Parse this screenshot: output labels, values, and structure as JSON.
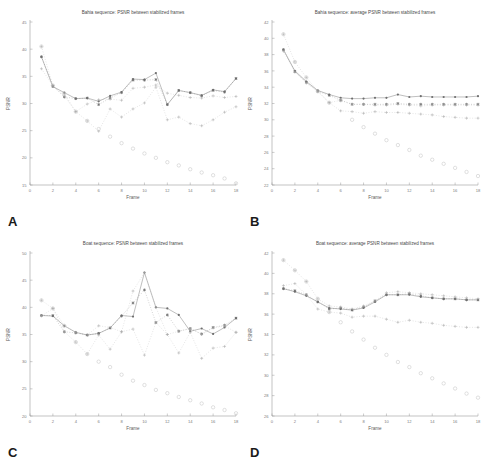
{
  "figure": {
    "panel_labels": [
      "A",
      "B",
      "C",
      "D"
    ],
    "xlabel": "Frame",
    "ylabel": "PSNR",
    "colors": {
      "series_solid": "#8a8a8a",
      "series_star": "#6e6e6e",
      "series_plus": "#a8a8a8",
      "series_circle": "#c0c0c0",
      "axis": "#9a9a9a",
      "text": "#7c7c7c"
    }
  },
  "chart_data": [
    {
      "panel": "A",
      "type": "line",
      "title": "Bahia sequence: PSNR between stabilized frames",
      "xlabel": "Frame",
      "ylabel": "PSNR",
      "xlim": [
        0,
        18
      ],
      "ylim": [
        15,
        45
      ],
      "xticks": [
        0,
        2,
        4,
        6,
        8,
        10,
        12,
        14,
        16,
        18
      ],
      "yticks": [
        15,
        20,
        25,
        30,
        35,
        40,
        45
      ],
      "grid": false,
      "legend": "none",
      "x": [
        1,
        2,
        3,
        4,
        5,
        6,
        7,
        8,
        9,
        10,
        11,
        12,
        13,
        14,
        15,
        16,
        17,
        18
      ],
      "series": [
        {
          "name": "solid-line",
          "marker": "line",
          "values": [
            38.6,
            33.1,
            32.0,
            30.9,
            31.0,
            30.4,
            31.4,
            32.1,
            34.5,
            34.4,
            35.6,
            29.8,
            32.4,
            32.0,
            31.5,
            32.5,
            32.2,
            34.6
          ]
        },
        {
          "name": "star",
          "marker": "star",
          "values": [
            38.6,
            33.2,
            31.2,
            30.9,
            31.0,
            29.8,
            31.0,
            32.0,
            34.3,
            34.3,
            34.4,
            29.8,
            32.4,
            32.0,
            31.4,
            32.4,
            32.1,
            34.6
          ]
        },
        {
          "name": "plus",
          "marker": "plus",
          "values": [
            40.5,
            33.3,
            31.8,
            28.5,
            29.9,
            30.7,
            30.8,
            30.6,
            32.8,
            33.0,
            33.4,
            31.9,
            31.5,
            31.1,
            31.0,
            31.4,
            31.1,
            31.3
          ]
        },
        {
          "name": "plus-low",
          "marker": "plus",
          "values": [
            36.4,
            33.3,
            31.4,
            28.5,
            26.8,
            24.9,
            29.0,
            27.5,
            29.0,
            30.1,
            33.0,
            27.0,
            27.5,
            26.3,
            25.9,
            27.0,
            28.4,
            29.4
          ]
        },
        {
          "name": "circle",
          "marker": "circle",
          "values": [
            40.5,
            33.3,
            31.8,
            28.5,
            26.8,
            25.3,
            23.9,
            22.7,
            21.7,
            20.8,
            20.0,
            19.2,
            18.6,
            17.9,
            17.3,
            16.8,
            16.2,
            15.3
          ]
        }
      ]
    },
    {
      "panel": "B",
      "type": "line",
      "title": "Bahia sequence: average PSNR between stabilized frames",
      "xlabel": "Frame",
      "ylabel": "PSNR",
      "xlim": [
        0,
        18
      ],
      "ylim": [
        22,
        42
      ],
      "xticks": [
        0,
        2,
        4,
        6,
        8,
        10,
        12,
        14,
        16,
        18
      ],
      "yticks": [
        22,
        24,
        26,
        28,
        30,
        32,
        34,
        36,
        38,
        40,
        42
      ],
      "grid": false,
      "legend": "none",
      "x": [
        1,
        2,
        3,
        4,
        5,
        6,
        7,
        8,
        9,
        10,
        11,
        12,
        13,
        14,
        15,
        16,
        17,
        18
      ],
      "series": [
        {
          "name": "solid-line",
          "marker": "line",
          "values": [
            38.6,
            36.0,
            34.7,
            33.6,
            33.1,
            32.7,
            32.6,
            32.6,
            32.7,
            32.7,
            33.1,
            32.8,
            32.9,
            32.8,
            32.8,
            32.8,
            32.8,
            32.9
          ]
        },
        {
          "name": "star",
          "marker": "star",
          "values": [
            38.6,
            35.9,
            34.6,
            33.5,
            33.0,
            32.4,
            31.9,
            31.9,
            31.9,
            31.9,
            32.0,
            31.9,
            31.9,
            31.9,
            31.9,
            31.9,
            31.9,
            31.9
          ]
        },
        {
          "name": "plus",
          "marker": "plus",
          "values": [
            40.5,
            37.1,
            35.2,
            33.5,
            32.1,
            32.4,
            31.9,
            31.9,
            31.8,
            31.8,
            31.9,
            31.8,
            31.7,
            31.8,
            31.8,
            31.8,
            31.8,
            31.8
          ]
        },
        {
          "name": "plus-low",
          "marker": "plus",
          "values": [
            38.4,
            35.9,
            34.5,
            33.5,
            32.1,
            31.1,
            31.0,
            30.8,
            31.0,
            30.9,
            30.9,
            30.8,
            30.7,
            30.6,
            30.4,
            30.3,
            30.2,
            30.2
          ]
        },
        {
          "name": "circle",
          "marker": "circle",
          "values": [
            40.5,
            37.1,
            35.2,
            33.5,
            32.1,
            32.4,
            30.0,
            29.1,
            28.3,
            27.5,
            26.9,
            26.3,
            25.6,
            25.1,
            24.6,
            24.1,
            23.6,
            23.1
          ]
        }
      ]
    },
    {
      "panel": "C",
      "type": "line",
      "title": "Boat sequence: PSNR between stabilized frames",
      "xlabel": "Frame",
      "ylabel": "PSNR",
      "xlim": [
        0,
        18
      ],
      "ylim": [
        20,
        50
      ],
      "xticks": [
        0,
        2,
        4,
        6,
        8,
        10,
        12,
        14,
        16,
        18
      ],
      "yticks": [
        20,
        25,
        30,
        35,
        40,
        45,
        50
      ],
      "grid": false,
      "legend": "none",
      "x": [
        1,
        2,
        3,
        4,
        5,
        6,
        7,
        8,
        9,
        10,
        11,
        12,
        13,
        14,
        15,
        16,
        17,
        18
      ],
      "series": [
        {
          "name": "solid-line",
          "marker": "line",
          "values": [
            38.5,
            38.4,
            36.6,
            35.4,
            34.9,
            35.2,
            36.2,
            38.5,
            38.3,
            46.4,
            40.0,
            39.8,
            38.6,
            35.6,
            36.1,
            35.1,
            36.3,
            38.0
          ]
        },
        {
          "name": "star",
          "marker": "star",
          "values": [
            38.5,
            38.5,
            35.5,
            35.3,
            34.9,
            35.2,
            36.2,
            38.4,
            40.8,
            43.2,
            37.2,
            38.6,
            35.6,
            36.1,
            35.1,
            36.3,
            36.7,
            38.0
          ]
        },
        {
          "name": "plus",
          "marker": "plus",
          "values": [
            41.3,
            39.8,
            36.6,
            35.4,
            34.9,
            36.6,
            36.3,
            35.5,
            43.0,
            46.4,
            40.0,
            35.0,
            35.6,
            36.1,
            35.0,
            36.2,
            36.6,
            35.4
          ]
        },
        {
          "name": "plus-low",
          "marker": "plus",
          "values": [
            38.4,
            39.8,
            35.5,
            33.6,
            31.4,
            34.9,
            32.3,
            35.5,
            36.0,
            31.2,
            37.2,
            35.0,
            31.6,
            35.4,
            30.6,
            32.5,
            32.8,
            35.4
          ]
        },
        {
          "name": "circle",
          "marker": "circle",
          "values": [
            41.3,
            39.8,
            36.6,
            33.6,
            31.4,
            30.0,
            29.0,
            27.6,
            26.5,
            25.7,
            24.8,
            24.2,
            23.5,
            22.9,
            22.3,
            21.6,
            21.1,
            20.5
          ]
        }
      ]
    },
    {
      "panel": "D",
      "type": "line",
      "title": "Boat sequence: average PSNR between stabilized frames",
      "xlabel": "Frame",
      "ylabel": "PSNR",
      "xlim": [
        0,
        18
      ],
      "ylim": [
        26,
        42
      ],
      "xticks": [
        0,
        2,
        4,
        6,
        8,
        10,
        12,
        14,
        16,
        18
      ],
      "yticks": [
        26,
        28,
        30,
        32,
        34,
        36,
        38,
        40,
        42
      ],
      "grid": false,
      "legend": "none",
      "x": [
        1,
        2,
        3,
        4,
        5,
        6,
        7,
        8,
        9,
        10,
        11,
        12,
        13,
        14,
        15,
        16,
        17,
        18
      ],
      "series": [
        {
          "name": "solid-line",
          "marker": "line",
          "values": [
            38.5,
            38.2,
            37.8,
            37.2,
            36.6,
            36.5,
            36.4,
            36.6,
            37.2,
            37.9,
            37.9,
            37.9,
            37.7,
            37.6,
            37.5,
            37.5,
            37.4,
            37.4
          ]
        },
        {
          "name": "star",
          "marker": "star",
          "values": [
            38.5,
            38.3,
            37.9,
            37.2,
            36.5,
            36.6,
            36.4,
            36.7,
            37.3,
            37.9,
            37.9,
            38.0,
            37.8,
            37.6,
            37.5,
            37.5,
            37.4,
            37.4
          ]
        },
        {
          "name": "plus",
          "marker": "plus",
          "values": [
            41.3,
            40.3,
            39.2,
            37.5,
            36.8,
            36.7,
            36.5,
            36.8,
            37.3,
            38.1,
            38.2,
            38.1,
            38.0,
            37.9,
            37.8,
            37.7,
            37.6,
            37.5
          ]
        },
        {
          "name": "plus-low",
          "marker": "plus",
          "values": [
            38.8,
            39.0,
            37.9,
            36.5,
            36.2,
            36.1,
            35.7,
            35.8,
            35.8,
            35.5,
            35.2,
            35.4,
            35.2,
            35.1,
            34.9,
            34.8,
            34.7,
            34.7
          ]
        },
        {
          "name": "circle",
          "marker": "circle",
          "values": [
            41.3,
            40.3,
            39.2,
            37.5,
            36.2,
            35.2,
            34.3,
            33.5,
            32.7,
            32.0,
            31.3,
            30.8,
            30.2,
            29.7,
            29.2,
            28.7,
            28.2,
            27.8
          ]
        }
      ]
    }
  ]
}
